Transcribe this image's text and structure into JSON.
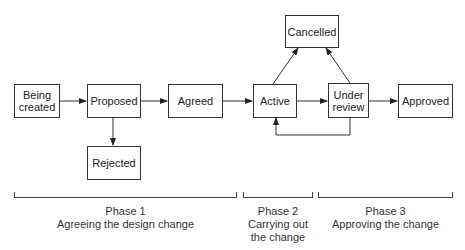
{
  "diagram": {
    "type": "state-transition flow",
    "nodes": [
      {
        "id": "being_created",
        "label": "Being\ncreated"
      },
      {
        "id": "proposed",
        "label": "Proposed"
      },
      {
        "id": "rejected",
        "label": "Rejected"
      },
      {
        "id": "agreed",
        "label": "Agreed"
      },
      {
        "id": "active",
        "label": "Active"
      },
      {
        "id": "cancelled",
        "label": "Cancelled"
      },
      {
        "id": "under_review",
        "label": "Under\nreview"
      },
      {
        "id": "approved",
        "label": "Approved"
      }
    ],
    "edges": [
      {
        "from": "being_created",
        "to": "proposed"
      },
      {
        "from": "proposed",
        "to": "agreed"
      },
      {
        "from": "proposed",
        "to": "rejected"
      },
      {
        "from": "agreed",
        "to": "active"
      },
      {
        "from": "active",
        "to": "under_review"
      },
      {
        "from": "active",
        "to": "cancelled"
      },
      {
        "from": "under_review",
        "to": "cancelled"
      },
      {
        "from": "under_review",
        "to": "approved"
      },
      {
        "from": "under_review",
        "to": "active"
      }
    ],
    "phases": [
      {
        "title": "Phase 1",
        "description": "Agreeing the design change"
      },
      {
        "title": "Phase 2",
        "description": "Carrying out\nthe change"
      },
      {
        "title": "Phase 3",
        "description": "Approving the change"
      }
    ]
  }
}
